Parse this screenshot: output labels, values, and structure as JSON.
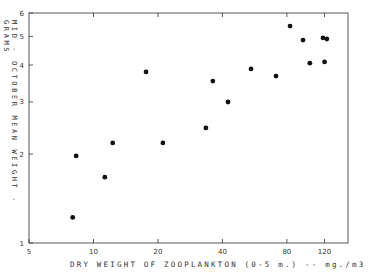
{
  "chart_data": {
    "type": "scatter",
    "title": "",
    "xlabel": "DRY WEIGHT OF ZOOPLANKTON (0-5 m.) -- mg./m3",
    "ylabel": "MID - OCTOBER   MEAN   WEIGHT - GRAMS",
    "xscale": "log",
    "yscale": "log",
    "xlim": [
      5,
      160
    ],
    "ylim": [
      1,
      6
    ],
    "x_ticks": [
      5,
      10,
      20,
      40,
      80,
      120
    ],
    "y_ticks": [
      1,
      2,
      3,
      4,
      5,
      6
    ],
    "grid": false,
    "legend": null,
    "series": [
      {
        "name": "observations",
        "points": [
          {
            "x": 8.0,
            "y": 1.22
          },
          {
            "x": 8.3,
            "y": 1.97
          },
          {
            "x": 11.3,
            "y": 1.67
          },
          {
            "x": 12.3,
            "y": 2.18
          },
          {
            "x": 17.6,
            "y": 3.79
          },
          {
            "x": 21.1,
            "y": 2.18
          },
          {
            "x": 33.5,
            "y": 2.45
          },
          {
            "x": 36.1,
            "y": 3.53
          },
          {
            "x": 42.5,
            "y": 3.0
          },
          {
            "x": 54.4,
            "y": 3.88
          },
          {
            "x": 71.2,
            "y": 3.67
          },
          {
            "x": 82.8,
            "y": 5.42
          },
          {
            "x": 95.2,
            "y": 4.86
          },
          {
            "x": 102.4,
            "y": 4.06
          },
          {
            "x": 118,
            "y": 4.94
          },
          {
            "x": 120,
            "y": 4.1
          },
          {
            "x": 123,
            "y": 4.9
          }
        ]
      }
    ]
  },
  "colors": {
    "axis": "#555555",
    "point": "#111111"
  }
}
